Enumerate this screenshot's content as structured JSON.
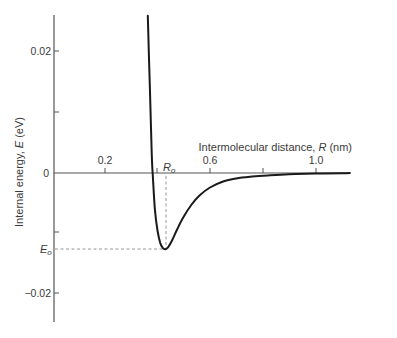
{
  "chart_data": {
    "type": "line",
    "title": "",
    "xlabel": "Intermolecular distance, R (nm)",
    "ylabel": "Internal energy, E (eV)",
    "xlim": [
      0,
      1.14
    ],
    "ylim": [
      -0.025,
      0.026
    ],
    "x_ticks": [
      {
        "value": 0.2,
        "label": "0.2"
      },
      {
        "value": 0.4,
        "label": ""
      },
      {
        "value": 0.6,
        "label": "0.6"
      },
      {
        "value": 0.8,
        "label": ""
      },
      {
        "value": 1.0,
        "label": "1.0"
      }
    ],
    "y_ticks": [
      {
        "value": 0.02,
        "label": "0.02"
      },
      {
        "value": 0.01,
        "label": ""
      },
      {
        "value": 0,
        "label": "0"
      },
      {
        "value": -0.01,
        "label": ""
      },
      {
        "value": -0.02,
        "label": "−0.02"
      }
    ],
    "grid": false,
    "legend": null,
    "series": [
      {
        "name": "Potential energy curve",
        "color": "#1a1a1a",
        "x": [
          0.363,
          0.367,
          0.371,
          0.375,
          0.379,
          0.383,
          0.39,
          0.4,
          0.41,
          0.42,
          0.43,
          0.44,
          0.455,
          0.475,
          0.5,
          0.53,
          0.56,
          0.6,
          0.65,
          0.7,
          0.76,
          0.82,
          0.9,
          1.0,
          1.1,
          1.133
        ],
        "y": [
          0.026,
          0.02,
          0.014,
          0.008,
          0.002,
          -0.001,
          -0.006,
          -0.0095,
          -0.0115,
          -0.0124,
          -0.0126,
          -0.0123,
          -0.0112,
          -0.0093,
          -0.0072,
          -0.0052,
          -0.0037,
          -0.0024,
          -0.0014,
          -0.0009,
          -0.0006,
          -0.0004,
          -0.0002,
          -0.0001,
          -5e-05,
          0.0
        ]
      }
    ],
    "annotations": [
      {
        "text": "R₀",
        "x": 0.43,
        "y": 0,
        "meaning": "equilibrium separation",
        "value_nm": 0.43,
        "style": "dashed vertical guide"
      },
      {
        "text": "E₀",
        "x": 0,
        "y": -0.0126,
        "meaning": "minimum energy",
        "value_eV": -0.0126,
        "style": "dashed horizontal guide"
      }
    ]
  },
  "labels": {
    "x_axis_title": "Intermolecular distance, ",
    "x_axis_var": "R",
    "x_axis_unit": " (nm)",
    "y_axis_title": "Internal energy, ",
    "y_axis_var": "E",
    "y_axis_unit": " (eV)",
    "r0_base": "R",
    "r0_sub": "o",
    "e0_base": "E",
    "e0_sub": "o",
    "xtick_02": "0.2",
    "xtick_06": "0.6",
    "xtick_10": "1.0",
    "ytick_p002": "0.02",
    "ytick_0": "0",
    "ytick_m002": "−0.02"
  },
  "colors": {
    "axis": "#555555",
    "curve": "#1a1a1a",
    "guide": "#8a8a8a"
  }
}
